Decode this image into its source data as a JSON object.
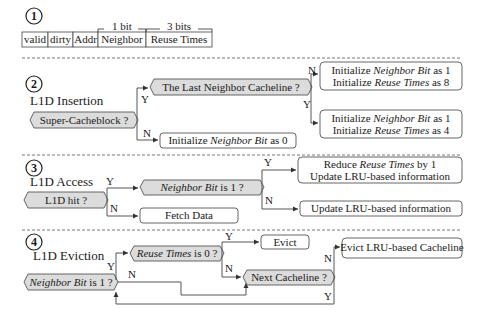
{
  "section1": {
    "number": "1",
    "fields": [
      "valid",
      "dirty",
      "Addr",
      "Neighbor",
      "Reuse Times"
    ],
    "bit_labels": {
      "neighbor": "1 bit",
      "reuse": "3 bits"
    }
  },
  "section2": {
    "number": "2",
    "title": "L1D Insertion",
    "decision": "Super-Cacheblock ?",
    "decision2": "The Last Neighbor Cacheline ?",
    "yes": "Y",
    "no": "N",
    "no_action": {
      "pre": "Initialize ",
      "em": "Neighbor Bit",
      "post": " as 0"
    },
    "last_no_action": {
      "line1": {
        "pre": "Initialize ",
        "em": "Neighbor Bit",
        "post": " as 1"
      },
      "line2": {
        "pre": "Initialize ",
        "em": "Reuse Times",
        "post": " as 8"
      }
    },
    "last_yes_action": {
      "line1": {
        "pre": "Initialize ",
        "em": "Neighbor Bit",
        "post": " as 1"
      },
      "line2": {
        "pre": "Initialize ",
        "em": "Reuse Times",
        "post": " as 4"
      }
    }
  },
  "section3": {
    "number": "3",
    "title": "L1D Access",
    "decision": "L1D hit ?",
    "decision2": {
      "em": "Neighbor Bit",
      "post": " is 1 ?"
    },
    "yes": "Y",
    "no": "N",
    "miss_action": "Fetch Data",
    "nb_yes_action": {
      "line1": {
        "pre": "Reduce ",
        "em": "Reuse Times",
        "post": " by 1"
      },
      "line2": "Update LRU-based information"
    },
    "nb_no_action": "Update LRU-based information"
  },
  "section4": {
    "number": "4",
    "title": "L1D Eviction",
    "decision": {
      "em": "Neighbor Bit",
      "post": " is 1 ?"
    },
    "decision2": {
      "em": "Reuse Times",
      "post": " is 0 ?"
    },
    "decision3": "Next Cacheline ?",
    "yes": "Y",
    "no": "N",
    "evict": "Evict",
    "evict_lru": "Evict LRU-based Cacheline"
  }
}
